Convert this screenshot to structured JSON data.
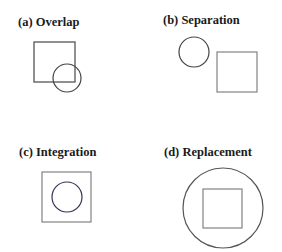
{
  "panels": [
    {
      "id": "a",
      "label": "(a) Overlap",
      "label_pos": [
        18,
        16
      ],
      "square": {
        "x": 34,
        "y": 42,
        "w": 41,
        "h": 40,
        "stroke": "#555555"
      },
      "circle": {
        "cx": 67,
        "cy": 78,
        "r": 14,
        "stroke": "#444444"
      }
    },
    {
      "id": "b",
      "label": "(b) Separation",
      "label_pos": [
        163,
        14
      ],
      "circle": {
        "cx": 194,
        "cy": 52,
        "r": 15,
        "stroke": "#444444"
      },
      "square": {
        "x": 217,
        "y": 52,
        "w": 40,
        "h": 40,
        "stroke": "#777777"
      }
    },
    {
      "id": "c",
      "label": "(c) Integration",
      "label_pos": [
        19,
        146
      ],
      "square": {
        "x": 42,
        "y": 172,
        "w": 49,
        "h": 50,
        "stroke": "#777777"
      },
      "circle": {
        "cx": 67,
        "cy": 197,
        "r": 15,
        "stroke": "#333355"
      }
    },
    {
      "id": "d",
      "label": "(d) Replacement",
      "label_pos": [
        164,
        146
      ],
      "circle": {
        "cx": 223,
        "cy": 208,
        "r": 40,
        "stroke": "#555555"
      },
      "square": {
        "x": 203,
        "y": 189,
        "w": 39,
        "h": 39,
        "stroke": "#777777"
      }
    }
  ]
}
